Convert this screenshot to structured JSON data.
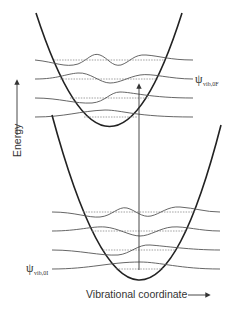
{
  "diagram": {
    "type": "Franck-Condon potential energy diagram",
    "y_axis": {
      "label": "Energy",
      "arrow": "up"
    },
    "x_axis": {
      "label": "Vibrational coordinate",
      "arrow": "right"
    },
    "upper_state": {
      "label_symbol": "ψ",
      "label_subscript": "vib,0F",
      "levels": 4
    },
    "lower_state": {
      "label_symbol": "ψ",
      "label_subscript": "vib,0I",
      "levels": 4
    },
    "transition": {
      "type": "vertical arrow",
      "direction": "up"
    },
    "colors": {
      "curve": "#222222",
      "wavefunction": "#555555",
      "level": "#888888",
      "text": "#333333"
    }
  }
}
